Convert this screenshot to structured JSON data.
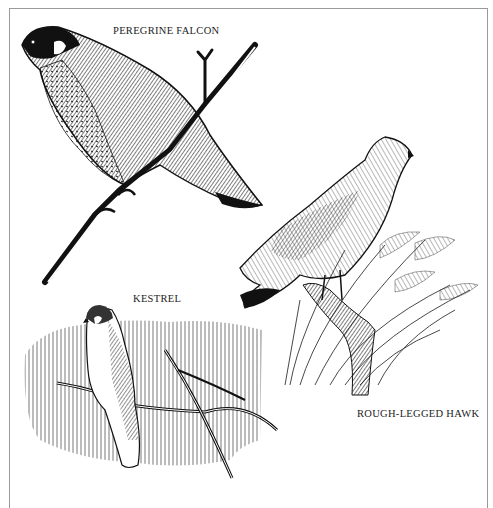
{
  "plate": {
    "labels": {
      "peregrine": "PEREGRINE FALCON",
      "kestrel": "KESTREL",
      "rough_legged": "ROUGH-LEGGED HAWK"
    },
    "colors": {
      "ink": "#111111",
      "paper": "#ffffff",
      "frame": "#9a9a9a"
    }
  }
}
